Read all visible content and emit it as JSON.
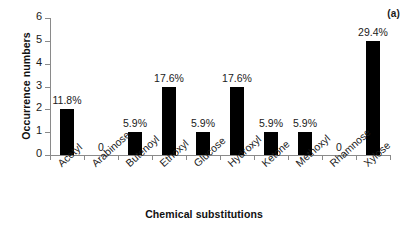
{
  "panel": {
    "label": "(a)"
  },
  "chart_data": {
    "type": "bar",
    "title": "",
    "xlabel": "Chemical substitutions",
    "ylabel": "Occurrence numbers",
    "ylim": [
      0,
      6
    ],
    "yticks": [
      0,
      1,
      2,
      3,
      4,
      5,
      6
    ],
    "grid": false,
    "legend": "none",
    "bar_color": "#000000",
    "categories": [
      "Acetyl",
      "Arabinose",
      "Butenoyl",
      "Ethoxyl",
      "Glucose",
      "Hydroxyl",
      "Ketone",
      "Methoxyl",
      "Rhamnose",
      "Xylose"
    ],
    "values": [
      2,
      0,
      1,
      3,
      1,
      3,
      1,
      1,
      0,
      5
    ],
    "data_labels": [
      "11.8%",
      "0",
      "5.9%",
      "17.6%",
      "5.9%",
      "17.6%",
      "5.9%",
      "5.9%",
      "0",
      "29.4%"
    ]
  }
}
